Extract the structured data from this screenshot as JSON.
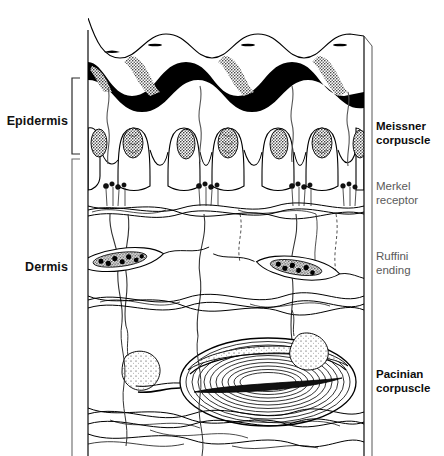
{
  "figure": {
    "layers": [
      {
        "id": "epidermis",
        "label": "Epidermis",
        "bracket_top_y": 78,
        "bracket_bottom_y": 154
      },
      {
        "id": "dermis",
        "label": "Dermis",
        "bracket_top_y": 158,
        "bracket_bottom_y": 456
      }
    ],
    "receptors": [
      {
        "id": "meissner",
        "line1": "Meissner",
        "line2": "corpuscle",
        "emphasis": "strong",
        "count_drawn": 6,
        "location": "dermal papillae tips, upper dermis"
      },
      {
        "id": "merkel",
        "line1": "Merkel",
        "line2": "receptor",
        "emphasis": "faint",
        "count_drawn": 4,
        "location": "base of epidermal rete ridges"
      },
      {
        "id": "ruffini",
        "line1": "Ruffini",
        "line2": "ending",
        "emphasis": "faint",
        "count_drawn": 2,
        "location": "mid dermis, spindle shaped along collagen"
      },
      {
        "id": "pacinian",
        "line1": "Pacinian",
        "line2": "corpuscle",
        "emphasis": "strong",
        "count_drawn": 1,
        "location": "deep dermis, concentric lamellae"
      }
    ],
    "skin_surface": {
      "ridge_count": 4,
      "has_sweat_pores": true,
      "stratum_band_color": "#000000"
    },
    "colors": {
      "ink": "#000000",
      "paper": "#ffffff",
      "faint_text": "#5a5a5a",
      "strong_text": "#0d0d0d",
      "bracket": "#2b2b2b"
    },
    "geometry": {
      "block_left_x": 88,
      "block_right_x": 364,
      "block_top_y": 18,
      "block_bottom_y": 456
    }
  }
}
